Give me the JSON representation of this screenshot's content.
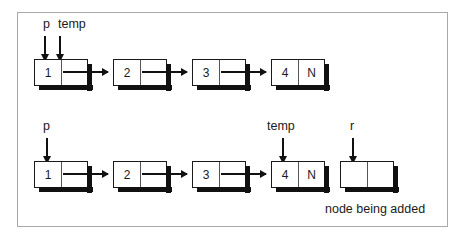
{
  "diagram": {
    "caption": "node being added",
    "null_marker": "N",
    "rows": [
      {
        "id": "row-before",
        "pointers": [
          {
            "name": "p",
            "target_node": 0
          },
          {
            "name": "temp",
            "target_node": 0
          }
        ],
        "nodes": [
          {
            "value": "1",
            "next": "2"
          },
          {
            "value": "2",
            "next": "3"
          },
          {
            "value": "3",
            "next": "4"
          },
          {
            "value": "4",
            "next": "N"
          }
        ]
      },
      {
        "id": "row-after",
        "pointers": [
          {
            "name": "p",
            "target_node": 0
          },
          {
            "name": "temp",
            "target_node": 3
          },
          {
            "name": "r",
            "target_node": 4
          }
        ],
        "nodes": [
          {
            "value": "1",
            "next": "2"
          },
          {
            "value": "2",
            "next": "3"
          },
          {
            "value": "3",
            "next": "4"
          },
          {
            "value": "4",
            "next": "N"
          },
          {
            "value": "",
            "next": ""
          }
        ]
      }
    ],
    "colors": {
      "frame_border": "#a9a9a9",
      "node_border": "#1a1a1a",
      "shadow": "#111111",
      "background": "#ffffff",
      "text": "#1a1a1a"
    }
  }
}
